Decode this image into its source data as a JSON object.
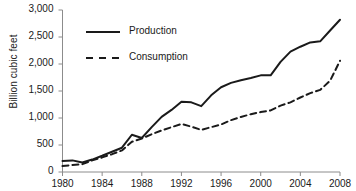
{
  "chart_data": {
    "type": "line",
    "title": "",
    "xlabel": "",
    "ylabel": "Billion cubic feet",
    "xlim": [
      1980,
      2008
    ],
    "ylim": [
      0,
      3000
    ],
    "grid": false,
    "legend_position": "upper-left-inside",
    "x_ticks": [
      "1980",
      "1984",
      "1988",
      "1992",
      "1996",
      "2000",
      "2004",
      "2008"
    ],
    "x_tick_values": [
      1980,
      1984,
      1988,
      1992,
      1996,
      2000,
      2004,
      2008
    ],
    "y_ticks": [
      "0",
      "500",
      "1,000",
      "1,500",
      "2,000",
      "2,500",
      "3,000"
    ],
    "y_tick_values": [
      0,
      500,
      1000,
      1500,
      2000,
      2500,
      3000
    ],
    "x": [
      1980,
      1981,
      1982,
      1983,
      1984,
      1985,
      1986,
      1987,
      1988,
      1989,
      1990,
      1991,
      1992,
      1993,
      1994,
      1995,
      1996,
      1997,
      1998,
      1999,
      2000,
      2001,
      2002,
      2003,
      2004,
      2005,
      2006,
      2007,
      2008
    ],
    "series": [
      {
        "name": "Production",
        "style": "solid",
        "color": "#1a1a1a",
        "values": [
          205,
          215,
          175,
          230,
          300,
          375,
          450,
          690,
          630,
          830,
          1020,
          1150,
          1300,
          1290,
          1220,
          1420,
          1570,
          1650,
          1700,
          1740,
          1790,
          1790,
          2040,
          2230,
          2320,
          2400,
          2420,
          2620,
          2820
        ]
      },
      {
        "name": "Consumption",
        "style": "dashed",
        "color": "#1a1a1a",
        "values": [
          110,
          130,
          145,
          215,
          270,
          330,
          400,
          560,
          620,
          700,
          770,
          830,
          890,
          840,
          780,
          830,
          880,
          960,
          1020,
          1070,
          1110,
          1140,
          1230,
          1290,
          1380,
          1460,
          1520,
          1690,
          2060
        ]
      }
    ],
    "legend": [
      {
        "label": "Production",
        "style": "solid"
      },
      {
        "label": "Consumption",
        "style": "dashed"
      }
    ]
  }
}
